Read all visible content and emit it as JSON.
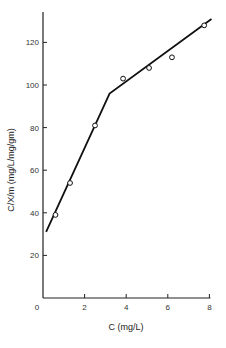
{
  "chart_data": {
    "type": "line",
    "title": "",
    "xlabel": "C (mg/L)",
    "ylabel": "C/X/m (mg/L/mg/gm)",
    "xlim": [
      0,
      8.2
    ],
    "ylim": [
      0,
      135
    ],
    "xticks": [
      0,
      2,
      4,
      6,
      8
    ],
    "yticks": [
      20,
      40,
      60,
      80,
      100,
      120
    ],
    "grid": false,
    "legend": null,
    "series": [
      {
        "name": "observed",
        "style": "open-circle-markers",
        "x": [
          0.6,
          1.3,
          2.5,
          3.85,
          5.1,
          6.2,
          7.75
        ],
        "y": [
          39,
          54,
          81,
          103,
          108,
          113,
          128
        ]
      },
      {
        "name": "fitted-piecewise-line",
        "style": "solid-line",
        "x": [
          0.15,
          3.2,
          8.1
        ],
        "y": [
          31,
          96,
          131
        ]
      }
    ]
  }
}
